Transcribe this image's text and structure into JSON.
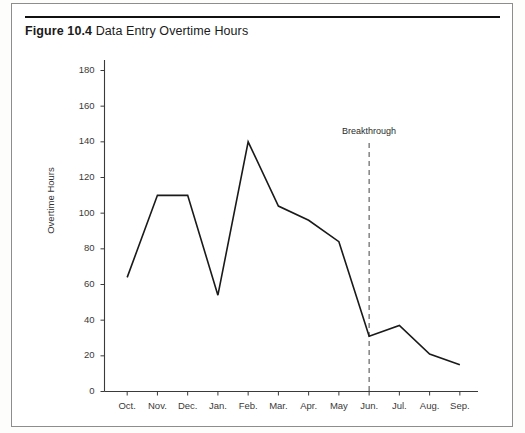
{
  "figure": {
    "number": "Figure 10.4",
    "title": "Data Entry Overtime Hours"
  },
  "chart_data": {
    "type": "line",
    "title": "Data Entry Overtime Hours",
    "xlabel": "",
    "ylabel": "Overtime Hours",
    "categories": [
      "Oct.",
      "Nov.",
      "Dec.",
      "Jan.",
      "Feb.",
      "Mar.",
      "Apr.",
      "May",
      "Jun.",
      "Jul.",
      "Aug.",
      "Sep."
    ],
    "values": [
      64,
      110,
      110,
      54,
      140,
      104,
      96,
      84,
      31,
      37,
      21,
      15
    ],
    "ylim": [
      0,
      180
    ],
    "yticks": [
      0,
      20,
      40,
      60,
      80,
      100,
      120,
      140,
      160,
      180
    ],
    "ytick_labels": [
      "0",
      "20",
      "40",
      "60",
      "80",
      "100",
      "120",
      "140",
      "160",
      "180"
    ],
    "grid": false,
    "legend": null,
    "annotations": [
      {
        "text": "Breakthrough",
        "at_category": "Jun.",
        "style": "dashed-vertical-line",
        "color": "#555555"
      }
    ],
    "line_color": "#1a1a1a",
    "line_width": 1.6,
    "markers": false
  },
  "axis": {
    "y_label": "Overtime Hours"
  }
}
